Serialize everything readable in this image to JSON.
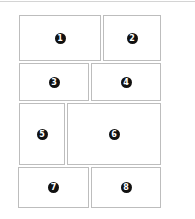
{
  "layout": {
    "border_color": "#bdbdbd",
    "badge_color": "#111111",
    "panels": [
      {
        "label": "1",
        "x": 19,
        "y": 15,
        "w": 82,
        "h": 46
      },
      {
        "label": "2",
        "x": 103,
        "y": 15,
        "w": 58,
        "h": 46
      },
      {
        "label": "3",
        "x": 19,
        "y": 63,
        "w": 70,
        "h": 38
      },
      {
        "label": "4",
        "x": 91,
        "y": 63,
        "w": 70,
        "h": 38
      },
      {
        "label": "5",
        "x": 19,
        "y": 103,
        "w": 46,
        "h": 62
      },
      {
        "label": "6",
        "x": 67,
        "y": 103,
        "w": 94,
        "h": 62
      },
      {
        "label": "7",
        "x": 18,
        "y": 167,
        "w": 71,
        "h": 41
      },
      {
        "label": "8",
        "x": 91,
        "y": 167,
        "w": 70,
        "h": 41
      }
    ]
  }
}
